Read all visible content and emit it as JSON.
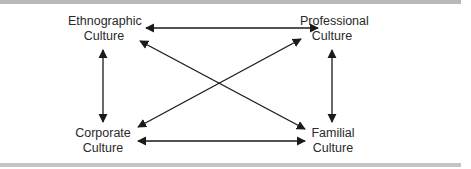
{
  "diagram": {
    "nodes": [
      {
        "id": "ethnographic",
        "line1": "Ethnographic",
        "line2": "Culture"
      },
      {
        "id": "professional",
        "line1": "Professional",
        "line2": "Culture"
      },
      {
        "id": "corporate",
        "line1": "Corporate",
        "line2": "Culture"
      },
      {
        "id": "familial",
        "line1": "Familial",
        "line2": "Culture"
      }
    ],
    "edges": [
      {
        "from": "ethnographic",
        "to": "professional",
        "direction": "bidirectional"
      },
      {
        "from": "corporate",
        "to": "familial",
        "direction": "bidirectional"
      },
      {
        "from": "ethnographic",
        "to": "corporate",
        "direction": "bidirectional"
      },
      {
        "from": "professional",
        "to": "familial",
        "direction": "bidirectional"
      },
      {
        "from": "ethnographic",
        "to": "familial",
        "direction": "bidirectional"
      },
      {
        "from": "corporate",
        "to": "professional",
        "direction": "bidirectional"
      }
    ],
    "colors": {
      "line": "#1a1a1a",
      "text": "#2a2a2a",
      "frame": "#b9b9b9"
    }
  }
}
